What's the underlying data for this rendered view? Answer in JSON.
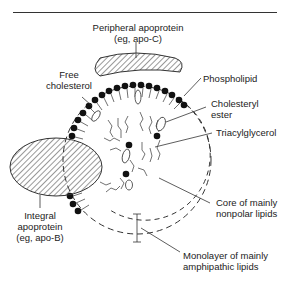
{
  "diagram": {
    "labels": {
      "peripheral_apoprotein": {
        "line1": "Peripheral apoprotein",
        "line2": "(eg, apo-C)"
      },
      "free_cholesterol": {
        "line1": "Free",
        "line2": "cholesterol"
      },
      "phospholipid": "Phospholipid",
      "cholesteryl_ester": {
        "line1": "Cholesteryl",
        "line2": "ester"
      },
      "triacylglycerol": "Triacylglycerol",
      "integral_apoprotein": {
        "line1": "Integral",
        "line2": "apoprotein",
        "line3": "(eg, apo-B)"
      },
      "core": {
        "line1": "Core of mainly",
        "line2": "nonpolar lipids"
      },
      "monolayer": {
        "line1": "Monolayer of mainly",
        "line2": "amphipathic lipids"
      }
    },
    "colors": {
      "ink": "#222222",
      "background": "#ffffff"
    }
  }
}
